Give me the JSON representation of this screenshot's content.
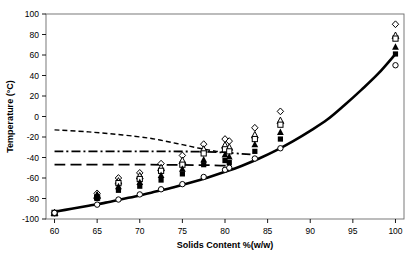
{
  "chart_data": {
    "type": "scatter",
    "title": "",
    "xlabel": "Solids Content %(w/w)",
    "ylabel": "Temperature (°C)",
    "xlim": [
      59,
      101
    ],
    "ylim": [
      -100,
      100
    ],
    "xticks": [
      60,
      65,
      70,
      75,
      80,
      85,
      90,
      95,
      100
    ],
    "yticks": [
      -100,
      -80,
      -60,
      -40,
      -20,
      0,
      20,
      40,
      60,
      80,
      100
    ],
    "xtick_labels": [
      "60",
      "65",
      "70",
      "75",
      "80",
      "85",
      "90",
      "95",
      "100"
    ],
    "ytick_labels": [
      "-100",
      "-80",
      "-60",
      "-40",
      "-20",
      "0",
      "20",
      "40",
      "60",
      "80",
      "100"
    ],
    "grid": false,
    "legend": "none",
    "series": [
      {
        "name": "model-curve",
        "type": "line",
        "style": "solid",
        "linewidth": 2.6,
        "color": "#000000",
        "x": [
          60,
          62,
          64,
          66,
          68,
          70,
          72,
          74,
          76,
          78,
          80,
          82,
          84,
          86,
          88,
          90,
          92,
          94,
          96,
          98,
          100
        ],
        "y": [
          -93,
          -90,
          -87,
          -84,
          -80.5,
          -77,
          -73,
          -69,
          -64.5,
          -59.5,
          -54,
          -48,
          -41,
          -33,
          -24,
          -14,
          -3,
          11,
          26,
          42,
          61
        ]
      },
      {
        "name": "fine-dashed-curve",
        "type": "line",
        "style": "dashed-fine",
        "linewidth": 1.4,
        "color": "#000000",
        "x": [
          60,
          64,
          68,
          71,
          73,
          75,
          77,
          79,
          80.5
        ],
        "y": [
          -13,
          -15,
          -18,
          -21,
          -24,
          -27.5,
          -31,
          -34,
          -35.5
        ]
      },
      {
        "name": "dash-dot-line",
        "type": "line",
        "style": "dash-dot",
        "linewidth": 1.8,
        "color": "#000000",
        "x": [
          60,
          70,
          78,
          83
        ],
        "y": [
          -34,
          -34,
          -34.5,
          -37
        ]
      },
      {
        "name": "long-dash-line",
        "type": "line",
        "style": "long-dash",
        "linewidth": 1.8,
        "color": "#000000",
        "x": [
          60,
          70,
          78,
          80.5
        ],
        "y": [
          -47,
          -47,
          -47.5,
          -48
        ]
      },
      {
        "name": "open-diamond",
        "type": "scatter",
        "marker": "diamond-open",
        "x": [
          60,
          65,
          67.5,
          70,
          72.5,
          75,
          77.5,
          80,
          80.5,
          83.5,
          86.5,
          100
        ],
        "y": [
          -94,
          -75,
          -60,
          -55,
          -46,
          -38,
          -27,
          -22,
          -24,
          -11,
          5,
          90
        ]
      },
      {
        "name": "open-triangle",
        "type": "scatter",
        "marker": "triangle-open",
        "x": [
          60,
          65,
          67.5,
          70,
          72.5,
          75,
          77.5,
          80,
          80.5,
          83.5,
          86.5,
          100
        ],
        "y": [
          -94,
          -77,
          -63,
          -58,
          -50,
          -43,
          -32,
          -28,
          -30,
          -18,
          -4,
          79
        ]
      },
      {
        "name": "open-square",
        "type": "scatter",
        "marker": "square-open",
        "x": [
          60,
          65,
          67.5,
          70,
          72.5,
          75,
          77.5,
          80,
          80.5,
          83.5,
          86.5,
          100
        ],
        "y": [
          -94,
          -79,
          -65,
          -61,
          -53,
          -47,
          -36,
          -32,
          -34,
          -22,
          -8,
          76
        ]
      },
      {
        "name": "filled-triangle",
        "type": "scatter",
        "marker": "triangle-filled",
        "x": [
          60,
          65,
          67.5,
          70,
          72.5,
          75,
          77.5,
          80,
          80.5,
          83.5,
          86.5,
          100
        ],
        "y": [
          -94,
          -76,
          -68,
          -64,
          -57,
          -51,
          -42,
          -37,
          -39,
          -27,
          -15,
          68
        ]
      },
      {
        "name": "filled-square",
        "type": "scatter",
        "marker": "square-filled",
        "x": [
          60,
          65,
          67.5,
          70,
          72.5,
          75,
          77.5,
          80,
          80.5,
          83.5,
          86.5,
          100
        ],
        "y": [
          -94,
          -80,
          -72,
          -68,
          -62,
          -56,
          -47,
          -43,
          -45,
          -34,
          -22,
          61
        ]
      },
      {
        "name": "open-circle",
        "type": "scatter",
        "marker": "circle-open",
        "x": [
          60,
          65,
          67.5,
          70,
          72.5,
          75,
          77.5,
          80,
          80.5,
          83.5,
          86.5,
          100
        ],
        "y": [
          -94,
          -86,
          -81,
          -76,
          -71,
          -66,
          -59,
          -52,
          -50,
          -41,
          -31,
          50
        ]
      }
    ]
  }
}
